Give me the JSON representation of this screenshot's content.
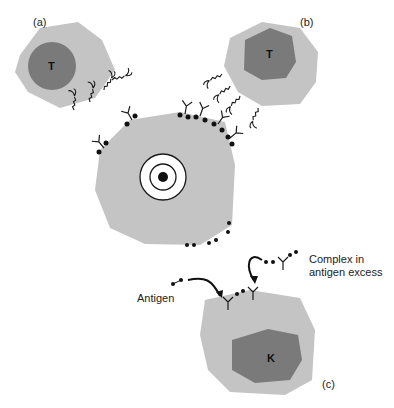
{
  "panels": {
    "a": {
      "label": "(a)",
      "cell_type": "T"
    },
    "b": {
      "label": "(b)",
      "cell_type": "T"
    },
    "c": {
      "label": "(c)",
      "cell_type": "K"
    }
  },
  "annotations": {
    "antigen": "Antigen",
    "complex_line1": "Complex in",
    "complex_line2": "antigen excess"
  },
  "colors": {
    "cytoplasm": "#c4c4c4",
    "nucleus": "#7a7a7a",
    "ink": "#1a1a1a"
  }
}
